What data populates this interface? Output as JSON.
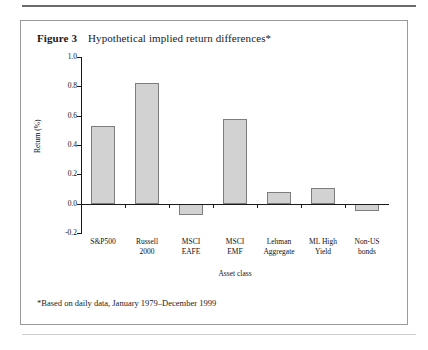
{
  "figure": {
    "number_label": "Figure 3",
    "caption": "Hypothetical implied return differences*",
    "footnote": "*Based on daily data, January 1979–December 1999"
  },
  "chart_data": {
    "type": "bar",
    "title": "Hypothetical implied return differences*",
    "xlabel": "Asset class",
    "ylabel": "Return (%)",
    "categories": [
      "S&P500",
      "Russell 2000",
      "MSCI EAFE",
      "MSCI EMF",
      "Lehman Aggregate",
      "ML High Yield",
      "Non-US bonds"
    ],
    "category_lines": [
      [
        "S&P500",
        ""
      ],
      [
        "Russell",
        "2000"
      ],
      [
        "MSCI",
        "EAFE"
      ],
      [
        "MSCI",
        "EMF"
      ],
      [
        "Lehman",
        "Aggregate"
      ],
      [
        "ML High",
        "Yield"
      ],
      [
        "Non-US",
        "bonds"
      ]
    ],
    "values": [
      0.53,
      0.82,
      -0.08,
      0.58,
      0.08,
      0.11,
      -0.05
    ],
    "ylim": [
      -0.2,
      1.0
    ],
    "yticks": [
      1.0,
      0.8,
      0.6,
      0.4,
      0.2,
      0.0,
      -0.2
    ],
    "ytick_labels": [
      "1.0",
      "0.8",
      "0.6",
      "0.4",
      "0.2",
      "0.0",
      "-0.2"
    ],
    "grid": false,
    "legend": "none",
    "bar_fill_color": "#d2d2d2",
    "bar_border_color": "#7d7d7d",
    "axis_color": "#1a1a1a"
  }
}
